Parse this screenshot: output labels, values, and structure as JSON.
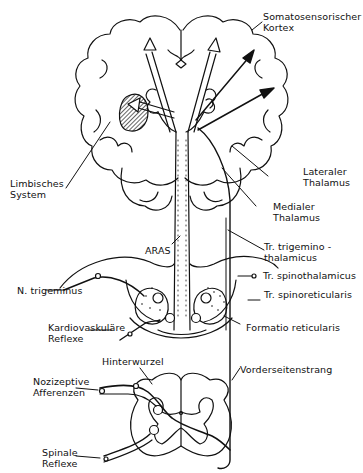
{
  "labels": {
    "somato": [
      "Somatosensorischer",
      "Kortex"
    ],
    "limbisch": [
      "Limbisches",
      "System"
    ],
    "aras": "ARAS",
    "lat_thal": [
      "Lateraler",
      "Thalamus"
    ],
    "med_thal": [
      "Medialer",
      "Thalamus"
    ],
    "tr_trig": [
      "Tr. trigemino -",
      "thalamicus"
    ],
    "n_trig": "N. trigeminus",
    "tr_spinothal": "Tr. spinothalamicus",
    "tr_spinoret": "Tr. spinoreticularis",
    "kardio": [
      "Kardiovaskuläre",
      "Reflexe"
    ],
    "formatio": "Formatio reticularis",
    "hinterwurzel": "Hinterwurzel",
    "vorderseiten": "Vorderseitenstrang",
    "nozi": [
      "Nozizeptive",
      "Afferenzen"
    ],
    "spinale": [
      "Spinale",
      "Reflexe"
    ]
  },
  "colors": {
    "ink": "#111111",
    "background": "#ffffff"
  }
}
